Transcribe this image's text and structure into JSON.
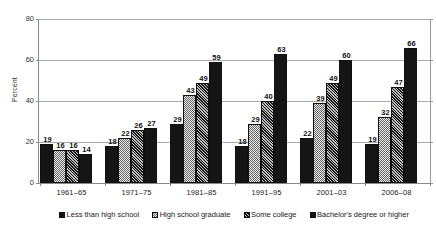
{
  "chart_data": {
    "type": "bar",
    "title": "",
    "subtitle": "",
    "xlabel": "",
    "ylabel": "Percent",
    "ylim": [
      0,
      80
    ],
    "yticks": [
      0,
      20,
      40,
      60,
      80
    ],
    "grid": true,
    "grid_axis": "y",
    "legend_position": "bottom",
    "orientation": "vertical",
    "categories": [
      "1961–65",
      "1971–75",
      "1981–85",
      "1991–95",
      "2001–03",
      "2006–08"
    ],
    "series": [
      {
        "name": "Less than high school",
        "fill": "solid-dark",
        "color": "#151515",
        "values": [
          19,
          18,
          29,
          18,
          22,
          19
        ]
      },
      {
        "name": "High school graduate",
        "fill": "dots-light",
        "color": "#e4e4e4",
        "values": [
          16,
          22,
          43,
          29,
          39,
          32
        ]
      },
      {
        "name": "Some college",
        "fill": "hatch-dark",
        "color": "#4a4a4a",
        "values": [
          16,
          26,
          49,
          40,
          49,
          47
        ]
      },
      {
        "name": "Bachelor's degree or higher",
        "fill": "solid-dark",
        "color": "#151515",
        "values": [
          14,
          27,
          59,
          63,
          60,
          66
        ]
      }
    ],
    "data_labels": true,
    "axis_color": "#8a8a8a",
    "gridline_color": "#a9a9a9",
    "bar_outline_color": "#111111"
  },
  "legend": {
    "items": [
      {
        "label": "Less than high school",
        "fill": "solid-dark"
      },
      {
        "label": "High school graduate",
        "fill": "dots-light"
      },
      {
        "label": "Some college",
        "fill": "hatch-dark"
      },
      {
        "label": "Bachelor's degree or higher",
        "fill": "solid-dark"
      }
    ]
  }
}
